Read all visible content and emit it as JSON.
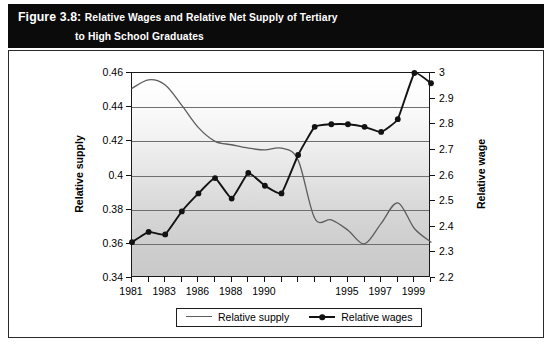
{
  "figure": {
    "label": "Figure 3.8:",
    "title_line1": "Relative Wages and Relative Net Supply of Tertiary",
    "title_line2": "to High School Graduates"
  },
  "legend": {
    "supply_label": "Relative supply",
    "wages_label": "Relative wages"
  },
  "chart_data": {
    "type": "line",
    "title": "Relative Wages and Relative Net Supply of Tertiary to High School Graduates",
    "xlabel": "",
    "ylabel": "Relative supply",
    "y2label": "Relative wage",
    "grid": true,
    "legend_position": "bottom",
    "x": [
      1981,
      1982,
      1983,
      1984,
      1985,
      1986,
      1987,
      1988,
      1989,
      1990,
      1991,
      1992,
      1993,
      1994,
      1995,
      1996,
      1997,
      1998,
      1999
    ],
    "xticklabels": [
      "1981",
      "",
      "1983",
      "",
      "1986",
      "",
      "1988",
      "",
      "1990",
      "",
      "",
      "",
      "",
      "1995",
      "",
      "1997",
      "",
      "1999",
      ""
    ],
    "xticklabels_shown": [
      "1981",
      "1983",
      "1986",
      "1988",
      "1990",
      "1995",
      "1997",
      "1999"
    ],
    "ylim": [
      0.34,
      0.46
    ],
    "yticks": [
      0.34,
      0.36,
      0.38,
      0.4,
      0.42,
      0.44,
      0.46
    ],
    "yticklabels": [
      "0.34",
      "0.36",
      "0.38",
      "0.4",
      "0.42",
      "0.44",
      "0.46"
    ],
    "y2lim": [
      2.2,
      3.0
    ],
    "y2ticks": [
      2.2,
      2.3,
      2.4,
      2.5,
      2.6,
      2.7,
      2.8,
      2.9,
      3.0
    ],
    "y2ticklabels": [
      "2.2",
      "2.3",
      "2.4",
      "2.5",
      "2.6",
      "2.7",
      "2.8",
      "2.9",
      "3"
    ],
    "series": [
      {
        "name": "Relative supply",
        "axis": "left",
        "color": "#5d5d5d",
        "markers": false,
        "values": [
          0.451,
          0.456,
          0.453,
          0.441,
          0.428,
          0.42,
          0.418,
          0.416,
          0.415,
          0.416,
          0.409,
          0.375,
          0.374,
          0.368,
          0.36,
          0.372,
          0.384,
          0.369,
          0.361
        ]
      },
      {
        "name": "Relative wages",
        "axis": "right",
        "color": "#121212",
        "markers": true,
        "values": [
          2.34,
          2.38,
          2.37,
          2.46,
          2.53,
          2.59,
          2.51,
          2.61,
          2.56,
          2.53,
          2.68,
          2.79,
          2.8,
          2.8,
          2.79,
          2.77,
          2.82,
          3.0,
          2.96
        ]
      }
    ]
  }
}
